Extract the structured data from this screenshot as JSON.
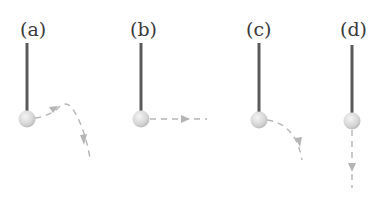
{
  "figure": {
    "panels": [
      {
        "label": "(a)",
        "trajectory": "rises then curves downward"
      },
      {
        "label": "(b)",
        "trajectory": "horizontal straight line"
      },
      {
        "label": "(c)",
        "trajectory": "curves downward"
      },
      {
        "label": "(d)",
        "trajectory": "straight down"
      }
    ]
  },
  "colors": {
    "string": "#5a5a5a",
    "ball": "#dcdcdc",
    "path": "#b5b5b5",
    "label": "#3a3a3a"
  }
}
